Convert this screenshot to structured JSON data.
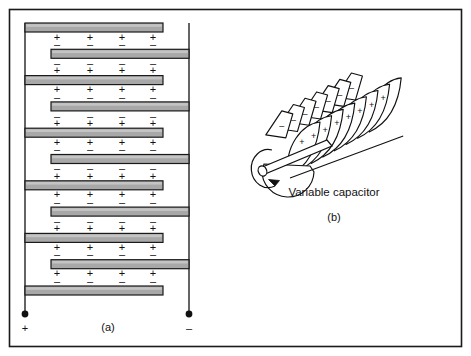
{
  "figure": {
    "border_color": "#1a1a1a",
    "background": "#ffffff",
    "ink_color": "#111111",
    "plate_fill": "#a8a8a8",
    "plate_fill_light": "#c4c4c4",
    "plate_stroke": "#1a1a1a"
  },
  "panel_a": {
    "label": "(a)",
    "terminal_positive": "+",
    "terminal_negative": "–",
    "plus_symbol": "+",
    "minus_symbol": "–",
    "signs_per_row": 4,
    "plate_count": 11,
    "gap_count": 10,
    "plates": [
      {
        "index": 0,
        "connected_to": "left",
        "charge_below": "+"
      },
      {
        "index": 1,
        "connected_to": "right",
        "charge_above": "–",
        "charge_below": "–"
      },
      {
        "index": 2,
        "connected_to": "left",
        "charge_above": "+",
        "charge_below": "+"
      },
      {
        "index": 3,
        "connected_to": "right",
        "charge_above": "–",
        "charge_below": "–"
      },
      {
        "index": 4,
        "connected_to": "left",
        "charge_above": "+",
        "charge_below": "+"
      },
      {
        "index": 5,
        "connected_to": "right",
        "charge_above": "–",
        "charge_below": "–"
      },
      {
        "index": 6,
        "connected_to": "left",
        "charge_above": "+",
        "charge_below": "+"
      },
      {
        "index": 7,
        "connected_to": "right",
        "charge_above": "–",
        "charge_below": "–"
      },
      {
        "index": 8,
        "connected_to": "left",
        "charge_above": "+",
        "charge_below": "+"
      },
      {
        "index": 9,
        "connected_to": "right",
        "charge_above": "–",
        "charge_below": "–"
      },
      {
        "index": 10,
        "connected_to": "left",
        "charge_above": "+"
      }
    ],
    "gaps": [
      {
        "index": 0,
        "top_row": "+",
        "bottom_row": "–"
      },
      {
        "index": 1,
        "top_row": "–",
        "bottom_row": "+"
      },
      {
        "index": 2,
        "top_row": "+",
        "bottom_row": "–"
      },
      {
        "index": 3,
        "top_row": "–",
        "bottom_row": "+"
      },
      {
        "index": 4,
        "top_row": "+",
        "bottom_row": "–"
      },
      {
        "index": 5,
        "top_row": "–",
        "bottom_row": "+"
      },
      {
        "index": 6,
        "top_row": "+",
        "bottom_row": "–"
      },
      {
        "index": 7,
        "top_row": "–",
        "bottom_row": "+"
      },
      {
        "index": 8,
        "top_row": "+",
        "bottom_row": "–"
      },
      {
        "index": 9,
        "top_row": "+",
        "bottom_row": "–"
      }
    ]
  },
  "panel_b": {
    "label": "(b)",
    "caption": "Variable capacitor",
    "rotor_charge": "+",
    "stator_charge": "–",
    "rotor_plate_count": 8,
    "stator_plate_count": 7,
    "rotor_signs": [
      "+",
      "+",
      "+",
      "+",
      "+",
      "+",
      "+",
      "+"
    ],
    "stator_signs": [
      "–",
      "–",
      "–",
      "–",
      "–",
      "–",
      "–"
    ]
  }
}
